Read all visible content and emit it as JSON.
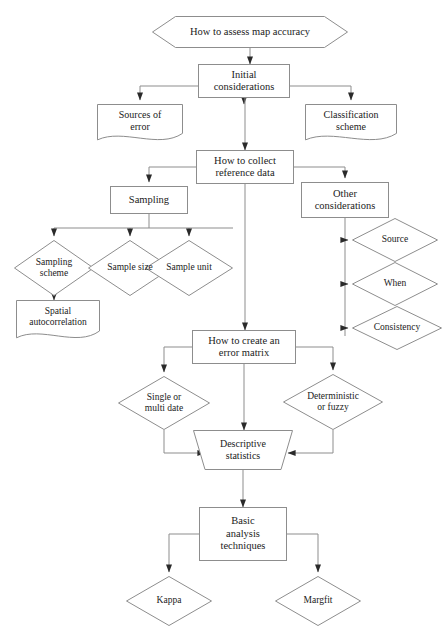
{
  "diagram": {
    "stroke_color": "#8d8d8d",
    "text_color": "#1b1b1b",
    "background": "#ffffff",
    "nodes": [
      {
        "id": "start",
        "label": "How to assess map accuracy",
        "shape": "hexagon",
        "x": 152,
        "y": 16,
        "w": 196,
        "h": 32,
        "fs": 10.5
      },
      {
        "id": "initial",
        "label": "Initial\nconsiderations",
        "shape": "rect",
        "x": 198,
        "y": 64,
        "w": 92,
        "h": 34,
        "fs": 10.5
      },
      {
        "id": "sources",
        "label": "Sources of\nerror",
        "shape": "document",
        "x": 97,
        "y": 104,
        "w": 86,
        "h": 38,
        "fs": 10
      },
      {
        "id": "classification",
        "label": "Classification\nscheme",
        "shape": "document",
        "x": 305,
        "y": 104,
        "w": 92,
        "h": 38,
        "fs": 10
      },
      {
        "id": "collect",
        "label": "How to collect\nreference data",
        "shape": "rect",
        "x": 196,
        "y": 150,
        "w": 98,
        "h": 34,
        "fs": 10.5
      },
      {
        "id": "sampling",
        "label": "Sampling",
        "shape": "rect",
        "x": 110,
        "y": 186,
        "w": 78,
        "h": 28,
        "fs": 10.5
      },
      {
        "id": "other",
        "label": "Other\nconsiderations",
        "shape": "rect",
        "x": 301,
        "y": 182,
        "w": 88,
        "h": 36,
        "fs": 10.5
      },
      {
        "id": "samp_scheme",
        "label": "Sampling\nscheme",
        "shape": "diamond",
        "x": 14,
        "y": 240,
        "w": 80,
        "h": 56,
        "fs": 9.5
      },
      {
        "id": "samp_size",
        "label": "Sample size",
        "shape": "diamond",
        "x": 88,
        "y": 240,
        "w": 84,
        "h": 56,
        "fs": 9.5
      },
      {
        "id": "samp_unit",
        "label": "Sample unit",
        "shape": "diamond",
        "x": 145,
        "y": 240,
        "w": 88,
        "h": 56,
        "fs": 9.5
      },
      {
        "id": "spatial",
        "label": "Spatial\nautocorrelation",
        "shape": "document",
        "x": 16,
        "y": 300,
        "w": 84,
        "h": 40,
        "fs": 9.5
      },
      {
        "id": "source",
        "label": "Source",
        "shape": "diamond",
        "x": 352,
        "y": 218,
        "w": 86,
        "h": 44,
        "fs": 9.5
      },
      {
        "id": "when",
        "label": "When",
        "shape": "diamond",
        "x": 352,
        "y": 262,
        "w": 86,
        "h": 44,
        "fs": 9.5
      },
      {
        "id": "consistency",
        "label": "Consistency",
        "shape": "diamond",
        "x": 352,
        "y": 306,
        "w": 90,
        "h": 44,
        "fs": 9.5
      },
      {
        "id": "errmatrix",
        "label": "How to create an\nerror matrix",
        "shape": "rect",
        "x": 192,
        "y": 330,
        "w": 104,
        "h": 34,
        "fs": 10.5
      },
      {
        "id": "single",
        "label": "Single or\nmulti date",
        "shape": "diamond",
        "x": 118,
        "y": 376,
        "w": 92,
        "h": 54,
        "fs": 9.5
      },
      {
        "id": "determ",
        "label": "Deterministic\nor fuzzy",
        "shape": "diamond",
        "x": 283,
        "y": 374,
        "w": 100,
        "h": 56,
        "fs": 9.5
      },
      {
        "id": "descr",
        "label": "Descriptive\nstatistics",
        "shape": "trapezoid",
        "x": 193,
        "y": 430,
        "w": 100,
        "h": 40,
        "fs": 10
      },
      {
        "id": "basic",
        "label": "Basic\nanalysis\ntechniques",
        "shape": "rect",
        "x": 199,
        "y": 507,
        "w": 88,
        "h": 54,
        "fs": 10.5
      },
      {
        "id": "kappa",
        "label": "Kappa",
        "shape": "diamond",
        "x": 126,
        "y": 576,
        "w": 86,
        "h": 50,
        "fs": 9.5
      },
      {
        "id": "margfit",
        "label": "Margfit",
        "shape": "diamond",
        "x": 275,
        "y": 576,
        "w": 86,
        "h": 50,
        "fs": 9.5
      }
    ],
    "edges": [
      {
        "from": "start",
        "to": "initial",
        "kind": "vertical"
      },
      {
        "from": "initial",
        "to": "sources",
        "kind": "elbow-left"
      },
      {
        "from": "initial",
        "to": "classification",
        "kind": "elbow-right"
      },
      {
        "from": "initial",
        "to": "collect",
        "kind": "vertical"
      },
      {
        "from": "collect",
        "to": "sampling",
        "kind": "elbow-left"
      },
      {
        "from": "collect",
        "to": "other",
        "kind": "elbow-right"
      },
      {
        "from": "collect",
        "to": "errmatrix",
        "kind": "vertical"
      },
      {
        "from": "sampling",
        "to": "samp_scheme",
        "kind": "fan"
      },
      {
        "from": "sampling",
        "to": "samp_size",
        "kind": "fan"
      },
      {
        "from": "sampling",
        "to": "samp_unit",
        "kind": "fan"
      },
      {
        "from": "samp_scheme",
        "to": "spatial",
        "kind": "vertical"
      },
      {
        "from": "other",
        "to": "source",
        "kind": "elbow-right"
      },
      {
        "from": "other",
        "to": "when",
        "kind": "elbow-right"
      },
      {
        "from": "other",
        "to": "consistency",
        "kind": "elbow-right"
      },
      {
        "from": "errmatrix",
        "to": "single",
        "kind": "elbow-left"
      },
      {
        "from": "errmatrix",
        "to": "determ",
        "kind": "elbow-right"
      },
      {
        "from": "errmatrix",
        "to": "descr",
        "kind": "vertical"
      },
      {
        "from": "single",
        "to": "descr",
        "kind": "elbow-in-left"
      },
      {
        "from": "determ",
        "to": "descr",
        "kind": "elbow-in-right"
      },
      {
        "from": "descr",
        "to": "basic",
        "kind": "vertical"
      },
      {
        "from": "basic",
        "to": "kappa",
        "kind": "elbow-left"
      },
      {
        "from": "basic",
        "to": "margfit",
        "kind": "elbow-right"
      }
    ]
  }
}
